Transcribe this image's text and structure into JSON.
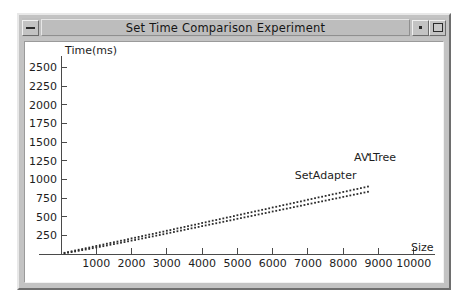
{
  "window": {
    "title": "Set Time Comparison Experiment",
    "buttons": {
      "minimize_left": "minimize-glyph",
      "minimize_right": "small-dot-glyph",
      "maximize_right": "maximize-box-glyph"
    }
  },
  "chart_data": {
    "type": "scatter",
    "title": "",
    "xlabel": "Size",
    "ylabel": "Time(ms)",
    "xlim": [
      0,
      10600
    ],
    "ylim": [
      0,
      2600
    ],
    "xticks": [
      1000,
      2000,
      3000,
      4000,
      5000,
      6000,
      7000,
      8000,
      9000,
      10000
    ],
    "yticks": [
      250,
      500,
      750,
      1000,
      1250,
      1500,
      1750,
      2000,
      2250,
      2500
    ],
    "grid": false,
    "legend_position": "inline-annotation",
    "annotations": [
      {
        "text": "AVLTree",
        "x": 8900,
        "y": 1250
      },
      {
        "text": "SetAdapter",
        "x": 7500,
        "y": 1000
      }
    ],
    "series": [
      {
        "name": "SetAdapter",
        "marker": "dot",
        "color": "#2c2c2c",
        "x": [
          100,
          200,
          300,
          400,
          500,
          600,
          700,
          800,
          900,
          1000,
          1100,
          1200,
          1300,
          1400,
          1500,
          1600,
          1700,
          1800,
          1900,
          2000,
          2100,
          2200,
          2300,
          2400,
          2500,
          2600,
          2700,
          2800,
          2900,
          3000,
          3100,
          3200,
          3300,
          3400,
          3500,
          3600,
          3700,
          3800,
          3900,
          4000,
          4100,
          4200,
          4300,
          4400,
          4500,
          4600,
          4700,
          4800,
          4900,
          5000,
          5100,
          5200,
          5300,
          5400,
          5500,
          5600,
          5700,
          5800,
          5900,
          6000,
          6100,
          6200,
          6300,
          6400,
          6500,
          6600,
          6700,
          6800,
          6900,
          7000,
          7100,
          7200,
          7300,
          7400,
          7500,
          7600,
          7700,
          7800,
          7900,
          8000,
          8100,
          8200,
          8300,
          8400,
          8500,
          8600,
          8700
        ],
        "y": [
          10,
          18,
          26,
          34,
          43,
          52,
          60,
          68,
          78,
          88,
          96,
          105,
          114,
          124,
          133,
          142,
          151,
          160,
          170,
          180,
          188,
          198,
          208,
          217,
          227,
          236,
          246,
          255,
          265,
          276,
          285,
          295,
          305,
          314,
          324,
          334,
          344,
          353,
          363,
          374,
          383,
          393,
          403,
          412,
          422,
          432,
          442,
          451,
          461,
          472,
          481,
          491,
          501,
          510,
          520,
          530,
          540,
          549,
          559,
          570,
          579,
          589,
          599,
          608,
          618,
          628,
          638,
          647,
          657,
          668,
          677,
          687,
          697,
          706,
          716,
          726,
          736,
          745,
          755,
          766,
          775,
          785,
          795,
          804,
          814,
          824,
          834
        ]
      },
      {
        "name": "AVLTree",
        "marker": "dot",
        "color": "#2c2c2c",
        "x": [
          100,
          200,
          300,
          400,
          500,
          600,
          700,
          800,
          900,
          1000,
          1100,
          1200,
          1300,
          1400,
          1500,
          1600,
          1700,
          1800,
          1900,
          2000,
          2100,
          2200,
          2300,
          2400,
          2500,
          2600,
          2700,
          2800,
          2900,
          3000,
          3100,
          3200,
          3300,
          3400,
          3500,
          3600,
          3700,
          3800,
          3900,
          4000,
          4100,
          4200,
          4300,
          4400,
          4500,
          4600,
          4700,
          4800,
          4900,
          5000,
          5100,
          5200,
          5300,
          5400,
          5500,
          5600,
          5700,
          5800,
          5900,
          6000,
          6100,
          6200,
          6300,
          6400,
          6500,
          6600,
          6700,
          6800,
          6900,
          7000,
          7100,
          7200,
          7300,
          7400,
          7500,
          7600,
          7700,
          7800,
          7900,
          8000,
          8100,
          8200,
          8300,
          8400,
          8500,
          8600,
          8700
        ],
        "y": [
          16,
          26,
          36,
          47,
          57,
          66,
          77,
          86,
          97,
          108,
          117,
          127,
          138,
          148,
          158,
          167,
          178,
          187,
          198,
          210,
          218,
          229,
          240,
          249,
          260,
          269,
          280,
          290,
          300,
          312,
          321,
          332,
          343,
          352,
          363,
          373,
          384,
          393,
          404,
          416,
          425,
          436,
          447,
          456,
          467,
          477,
          488,
          497,
          508,
          520,
          529,
          540,
          551,
          560,
          571,
          581,
          592,
          601,
          612,
          624,
          633,
          644,
          655,
          664,
          675,
          685,
          696,
          705,
          716,
          728,
          737,
          748,
          759,
          768,
          779,
          789,
          800,
          809,
          820,
          832,
          841,
          852,
          863,
          872,
          883,
          893,
          904
        ]
      },
      {
        "name": "outlier",
        "marker": "dot",
        "color": "#2c2c2c",
        "x": [
          8720
        ],
        "y": [
          1330
        ]
      }
    ]
  }
}
